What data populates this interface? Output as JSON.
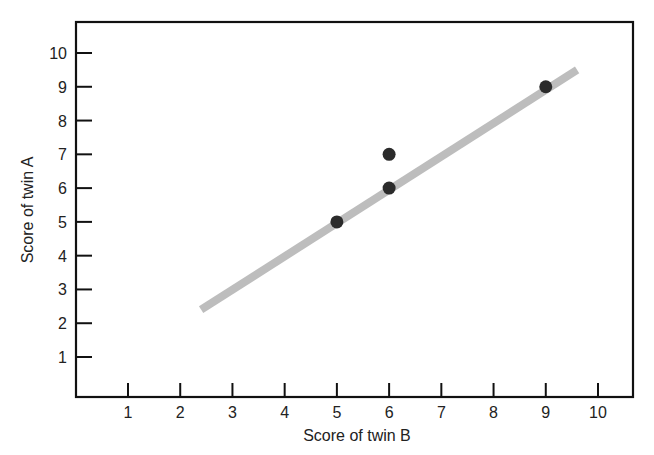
{
  "chart_data": {
    "type": "scatter",
    "title": "",
    "xlabel": "Score of twin B",
    "ylabel": "Score of twin A",
    "xlim": [
      0,
      10.6
    ],
    "ylim": [
      0,
      11
    ],
    "x_ticks": [
      1,
      2,
      3,
      4,
      5,
      6,
      7,
      8,
      9,
      10
    ],
    "y_ticks": [
      1,
      2,
      3,
      4,
      5,
      6,
      7,
      8,
      9,
      10
    ],
    "grid": false,
    "legend": null,
    "series": [
      {
        "name": "twin pairs",
        "points": [
          {
            "x": 5,
            "y": 5
          },
          {
            "x": 6,
            "y": 6
          },
          {
            "x": 6,
            "y": 7
          },
          {
            "x": 9,
            "y": 9
          }
        ],
        "marker": "circle",
        "color": "#2b2b2b"
      }
    ],
    "trend_line": {
      "from": {
        "x": 2.4,
        "y": 2.4
      },
      "to": {
        "x": 9.6,
        "y": 9.5
      },
      "color": "#bdbdbd"
    }
  }
}
